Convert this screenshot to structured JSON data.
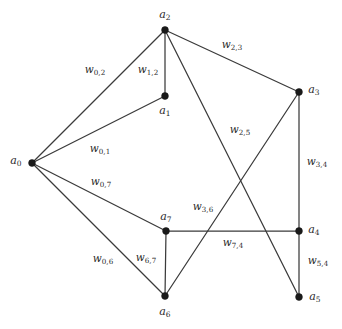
{
  "figure": {
    "type": "undirected-weighted-graph",
    "background_color": "#ffffff",
    "edge_color": "#3b3b3b",
    "vertex_color": "#1a1a1a",
    "width": 342,
    "height": 329
  },
  "vertices": [
    {
      "id": "a0",
      "base": "a",
      "sub": "0",
      "label": "a0",
      "x": 32,
      "y": 163,
      "label_x": 16,
      "label_y": 161
    },
    {
      "id": "a1",
      "base": "a",
      "sub": "1",
      "label": "a1",
      "x": 165,
      "y": 96,
      "label_x": 165,
      "label_y": 111
    },
    {
      "id": "a2",
      "base": "a",
      "sub": "2",
      "label": "a2",
      "x": 165,
      "y": 30,
      "label_x": 165,
      "label_y": 15
    },
    {
      "id": "a3",
      "base": "a",
      "sub": "3",
      "label": "a3",
      "x": 299,
      "y": 92,
      "label_x": 314,
      "label_y": 90
    },
    {
      "id": "a4",
      "base": "a",
      "sub": "4",
      "label": "a4",
      "x": 299,
      "y": 231,
      "label_x": 314,
      "label_y": 230
    },
    {
      "id": "a5",
      "base": "a",
      "sub": "5",
      "label": "a5",
      "x": 299,
      "y": 297,
      "label_x": 315,
      "label_y": 297
    },
    {
      "id": "a6",
      "base": "a",
      "sub": "6",
      "label": "a6",
      "x": 165,
      "y": 296,
      "label_x": 165,
      "label_y": 312
    },
    {
      "id": "a7",
      "base": "a",
      "sub": "7",
      "label": "a7",
      "x": 166,
      "y": 231,
      "label_x": 166,
      "label_y": 217
    }
  ],
  "edges": [
    {
      "id": "e-0-2",
      "from": "a0",
      "to": "a2",
      "weight_label": "w0,2",
      "weight_base": "w",
      "weight_sub": "0,2",
      "label_x": 95,
      "label_y": 70
    },
    {
      "id": "e-1-2",
      "from": "a1",
      "to": "a2",
      "weight_label": "w1,2",
      "weight_base": "w",
      "weight_sub": "1,2",
      "label_x": 148,
      "label_y": 70
    },
    {
      "id": "e-2-3",
      "from": "a2",
      "to": "a3",
      "weight_label": "w2,3",
      "weight_base": "w",
      "weight_sub": "2,3",
      "label_x": 232,
      "label_y": 45
    },
    {
      "id": "e-2-5",
      "from": "a2",
      "to": "a5",
      "weight_label": "w2,5",
      "weight_base": "w",
      "weight_sub": "2,5",
      "label_x": 240,
      "label_y": 130
    },
    {
      "id": "e-0-1",
      "from": "a0",
      "to": "a1",
      "weight_label": "w0,1",
      "weight_base": "w",
      "weight_sub": "0,1",
      "label_x": 100,
      "label_y": 149
    },
    {
      "id": "e-0-7",
      "from": "a0",
      "to": "a7",
      "weight_label": "w0,7",
      "weight_base": "w",
      "weight_sub": "0,7",
      "label_x": 101,
      "label_y": 182
    },
    {
      "id": "e-0-6",
      "from": "a0",
      "to": "a6",
      "weight_label": "w0,6",
      "weight_base": "w",
      "weight_sub": "0,6",
      "label_x": 103,
      "label_y": 259
    },
    {
      "id": "e-6-7",
      "from": "a6",
      "to": "a7",
      "weight_label": "w6,7",
      "weight_base": "w",
      "weight_sub": "6,7",
      "label_x": 146,
      "label_y": 258
    },
    {
      "id": "e-3-6",
      "from": "a3",
      "to": "a6",
      "weight_label": "w3,6",
      "weight_base": "w",
      "weight_sub": "3,6",
      "label_x": 203,
      "label_y": 207
    },
    {
      "id": "e-7-4",
      "from": "a7",
      "to": "a4",
      "weight_label": "w7,4",
      "weight_base": "w",
      "weight_sub": "7,4",
      "label_x": 233,
      "label_y": 243
    },
    {
      "id": "e-3-4",
      "from": "a3",
      "to": "a4",
      "weight_label": "w3,4",
      "weight_base": "w",
      "weight_sub": "3,4",
      "label_x": 317,
      "label_y": 162
    },
    {
      "id": "e-5-4",
      "from": "a5",
      "to": "a4",
      "weight_label": "w5,4",
      "weight_base": "w",
      "weight_sub": "5,4",
      "label_x": 318,
      "label_y": 261
    }
  ]
}
